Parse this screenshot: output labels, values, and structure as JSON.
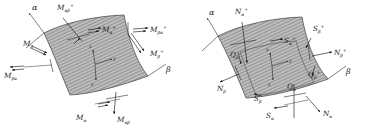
{
  "figure": {
    "background_color": "#ffffff",
    "surface_fill": "#b9b9b9",
    "line_color": "#2b2b2b",
    "panel_count": 2
  },
  "panels": [
    {
      "id": "moments",
      "caption": "Moment resultants on shell element",
      "axes": {
        "alpha": "α",
        "beta": "β"
      },
      "triad": {
        "x": "x",
        "y": "y",
        "z": "z"
      },
      "labels": [
        {
          "key": "m_ab_plus",
          "base": "M",
          "sub": "αβ",
          "sup": "+",
          "x": 57,
          "y": 10,
          "anchor": "start"
        },
        {
          "key": "m_a_plus",
          "base": "M",
          "sub": "α",
          "sup": "+",
          "x": 104,
          "y": 32,
          "anchor": "start"
        },
        {
          "key": "m_ba_plus",
          "base": "M",
          "sub": "βα",
          "sup": "+",
          "x": 152,
          "y": 31,
          "anchor": "start"
        },
        {
          "key": "m_b_plus",
          "base": "M",
          "sub": "β",
          "sup": "+",
          "x": 152,
          "y": 55,
          "anchor": "start"
        },
        {
          "key": "m_b",
          "base": "M",
          "sub": "β",
          "sup": "",
          "x": 25,
          "y": 46,
          "anchor": "start"
        },
        {
          "key": "m_ba",
          "base": "M",
          "sub": "βα",
          "sup": "",
          "x": 6,
          "y": 74,
          "anchor": "start"
        },
        {
          "key": "m_a",
          "base": "M",
          "sub": "α",
          "sup": "",
          "x": 78,
          "y": 118,
          "anchor": "start"
        },
        {
          "key": "m_ab",
          "base": "M",
          "sub": "αβ",
          "sup": "",
          "x": 117,
          "y": 121,
          "anchor": "start"
        }
      ]
    },
    {
      "id": "forces",
      "caption": "Force resultants on shell element",
      "axes": {
        "alpha": "α",
        "beta": "β"
      },
      "triad": {
        "x": "x",
        "y": "y",
        "z": "z"
      },
      "labels": [
        {
          "key": "n_a_plus",
          "base": "N",
          "sub": "α",
          "sup": "+",
          "x": 53,
          "y": 14,
          "anchor": "start"
        },
        {
          "key": "s_a_plus",
          "base": "S",
          "sub": "α",
          "sup": "+",
          "x": 101,
          "y": 43,
          "anchor": "start"
        },
        {
          "key": "s_b_plus",
          "base": "S",
          "sub": "β",
          "sup": "+",
          "x": 131,
          "y": 31,
          "anchor": "start"
        },
        {
          "key": "n_b_plus",
          "base": "N",
          "sub": "β",
          "sup": "+",
          "x": 153,
          "y": 54,
          "anchor": "start"
        },
        {
          "key": "q_b_plus",
          "base": "Q",
          "sub": "β",
          "sup": "+",
          "x": 126,
          "y": 75,
          "anchor": "start"
        },
        {
          "key": "q_b",
          "base": "Q",
          "sub": "β",
          "sup": "",
          "x": 48,
          "y": 57,
          "anchor": "start"
        },
        {
          "key": "n_b",
          "base": "N",
          "sub": "β",
          "sup": "",
          "x": 37,
          "y": 90,
          "anchor": "start"
        },
        {
          "key": "s_b",
          "base": "S",
          "sub": "β",
          "sup": "",
          "x": 72,
          "y": 100,
          "anchor": "start"
        },
        {
          "key": "s_a",
          "base": "S",
          "sub": "α",
          "sup": "",
          "x": 84,
          "y": 117,
          "anchor": "start"
        },
        {
          "key": "q_a",
          "base": "Q",
          "sub": "α",
          "sup": "",
          "x": 106,
          "y": 88,
          "anchor": "start"
        },
        {
          "key": "n_a",
          "base": "N",
          "sub": "α",
          "sup": "",
          "x": 140,
          "y": 115,
          "anchor": "start"
        }
      ]
    }
  ]
}
